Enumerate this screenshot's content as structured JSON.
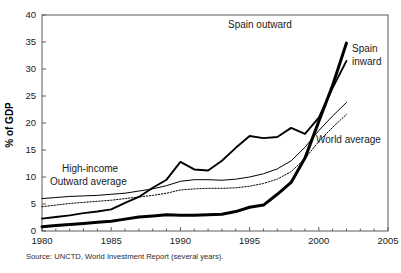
{
  "chart_data": {
    "type": "line",
    "title": "",
    "xlabel": "",
    "ylabel": "% of GDP",
    "xlim": [
      1980,
      2005
    ],
    "ylim": [
      0,
      40
    ],
    "xticks": [
      "1980",
      "1985",
      "1990",
      "1995",
      "2000",
      "2005"
    ],
    "yticks": [
      "0",
      "5",
      "10",
      "15",
      "20",
      "25",
      "30",
      "35",
      "40"
    ],
    "grid": false,
    "legend_position": "inline-annotations",
    "source": "Source: UNCTD, World Investment Report (several years).",
    "x": [
      1980,
      1981,
      1982,
      1983,
      1984,
      1985,
      1986,
      1987,
      1988,
      1989,
      1990,
      1991,
      1992,
      1993,
      1994,
      1995,
      1996,
      1997,
      1998,
      1999,
      2000,
      2001,
      2002
    ],
    "series": [
      {
        "name": "Spain inward",
        "label": "Spain inward",
        "style": "thin-dark",
        "color": "#111111",
        "width": 1.9,
        "values": [
          2.3,
          2.6,
          2.9,
          3.3,
          3.6,
          4.0,
          5.2,
          6.3,
          8.0,
          9.5,
          12.8,
          11.4,
          11.2,
          13.0,
          15.4,
          17.6,
          17.2,
          17.4,
          19.1,
          18.0,
          21.0,
          26.5,
          31.5
        ]
      },
      {
        "name": "Spain outward",
        "label": "Spain outward",
        "style": "thick-dark",
        "color": "#000000",
        "width": 3.0,
        "values": [
          0.8,
          1.0,
          1.2,
          1.4,
          1.6,
          1.8,
          2.2,
          2.6,
          2.8,
          3.0,
          2.9,
          2.9,
          3.0,
          3.1,
          3.6,
          4.4,
          4.8,
          6.8,
          9.0,
          13.5,
          20.3,
          27.0,
          34.8
        ]
      },
      {
        "name": "High-income outward average",
        "label": "High-income Outward average",
        "style": "thin-grey",
        "color": "#3b3b3b",
        "width": 1.0,
        "values": [
          6.0,
          6.2,
          6.4,
          6.5,
          6.6,
          6.8,
          7.0,
          7.4,
          7.8,
          8.4,
          9.2,
          9.5,
          9.5,
          9.4,
          9.6,
          10.0,
          10.6,
          11.5,
          13.0,
          15.5,
          18.6,
          21.3,
          23.8
        ]
      },
      {
        "name": "World average",
        "label": "World average",
        "style": "dotted",
        "color": "#5a5a5a",
        "width": 1.0,
        "values": [
          4.5,
          4.8,
          5.1,
          5.3,
          5.5,
          5.7,
          6.0,
          6.3,
          6.6,
          7.0,
          7.6,
          7.8,
          7.9,
          7.9,
          8.0,
          8.3,
          8.8,
          9.6,
          11.0,
          13.4,
          16.6,
          19.2,
          21.6
        ]
      }
    ],
    "annotations": [
      {
        "id": "spain-outward",
        "text": "Spain outward",
        "x": 228,
        "y": 28,
        "anchor": "start"
      },
      {
        "id": "spain-inward-1",
        "text": "Spain",
        "x": 352,
        "y": 52,
        "anchor": "start"
      },
      {
        "id": "spain-inward-2",
        "text": "inward",
        "x": 352,
        "y": 65,
        "anchor": "start"
      },
      {
        "id": "world-average",
        "text": "World average",
        "x": 316,
        "y": 143,
        "anchor": "start"
      },
      {
        "id": "high-income-1",
        "text": "High-income",
        "x": 62,
        "y": 172,
        "anchor": "start"
      },
      {
        "id": "high-income-2",
        "text": "Outward average",
        "x": 50,
        "y": 185,
        "anchor": "start"
      }
    ]
  }
}
